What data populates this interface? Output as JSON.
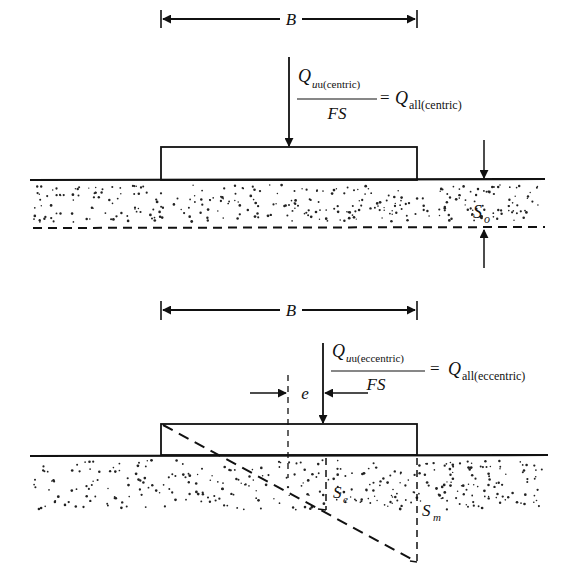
{
  "figure": {
    "type": "foundation settlement diagram",
    "colors": {
      "ink": "#111111",
      "background": "#ffffff",
      "soil_dots": "#222222"
    }
  },
  "top_panel": {
    "name": "centric-loading",
    "width_label": "B",
    "load_numerator": {
      "symbol": "Q",
      "sub": "u(centric)"
    },
    "load_denominator": "FS",
    "equals": "=",
    "load_result": {
      "symbol": "Q",
      "sub": "all(centric)"
    },
    "settlement_label": {
      "symbol": "S",
      "sub": "o"
    }
  },
  "bottom_panel": {
    "name": "eccentric-loading",
    "width_label": "B",
    "eccentricity_label": "e",
    "load_numerator": {
      "symbol": "Q",
      "sub": "u(eccentric)"
    },
    "load_denominator": "FS",
    "equals": "=",
    "load_result": {
      "symbol": "Q",
      "sub": "all(eccentric)"
    },
    "settlement_center_label": {
      "symbol": "S",
      "sub": "e"
    },
    "settlement_max_label": {
      "symbol": "S",
      "sub": "m"
    }
  }
}
